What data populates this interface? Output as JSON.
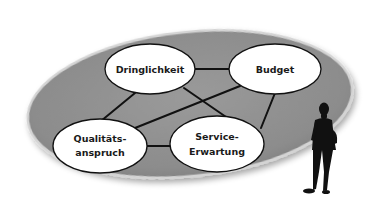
{
  "diagram": {
    "type": "network",
    "background_shape": "gray-ellipse",
    "colors": {
      "plate": "#8f8f8f",
      "plate_edge": "#cfcfcf",
      "node_fill": "#ffffff",
      "node_stroke": "#111111",
      "edge": "#111111",
      "silhouette": "#111111"
    },
    "nodes": [
      {
        "id": "dringlichkeit",
        "lines": [
          "Dringlichkeit"
        ]
      },
      {
        "id": "budget",
        "lines": [
          "Budget"
        ]
      },
      {
        "id": "qualitaetsanspruch",
        "lines": [
          "Qualitäts-",
          "anspruch"
        ]
      },
      {
        "id": "service_erwartung",
        "lines": [
          "Service-",
          "Erwartung"
        ]
      }
    ],
    "edges": [
      [
        "dringlichkeit",
        "budget"
      ],
      [
        "dringlichkeit",
        "qualitaetsanspruch"
      ],
      [
        "dringlichkeit",
        "service_erwartung"
      ],
      [
        "budget",
        "qualitaetsanspruch"
      ],
      [
        "budget",
        "service_erwartung"
      ],
      [
        "qualitaetsanspruch",
        "service_erwartung"
      ]
    ],
    "figure": "person-silhouette"
  }
}
